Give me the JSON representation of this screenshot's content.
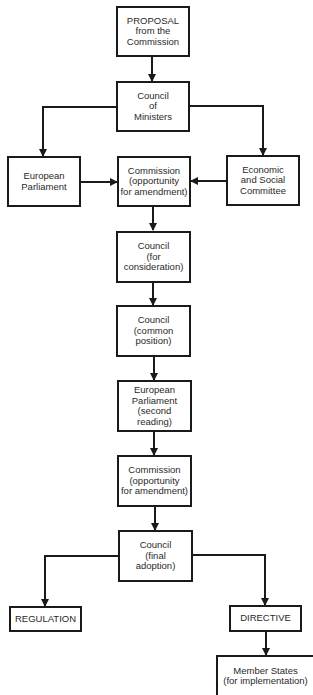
{
  "diagram": {
    "type": "flowchart",
    "nodes": {
      "proposal": {
        "lines": [
          "PROPOSAL",
          "from the",
          "Commission"
        ]
      },
      "council_ministers": {
        "lines": [
          "Council",
          "of",
          "Ministers"
        ]
      },
      "european_parliament": {
        "lines": [
          "European",
          "Parliament"
        ]
      },
      "commission_amend_1": {
        "lines": [
          "Commission",
          "(opportunity",
          "for amendment)"
        ]
      },
      "ecosoc": {
        "lines": [
          "Economic",
          "and Social",
          "Committee"
        ]
      },
      "council_consideration": {
        "lines": [
          "Council",
          "(for",
          "consideration)"
        ]
      },
      "council_common": {
        "lines": [
          "Council",
          "(common",
          "position)"
        ]
      },
      "ep_second": {
        "lines": [
          "European",
          "Parliament",
          "(second",
          "reading)"
        ]
      },
      "commission_amend_2": {
        "lines": [
          "Commission",
          "(opportunity",
          "for amendment)"
        ]
      },
      "council_final": {
        "lines": [
          "Council",
          "(final",
          "adoption)"
        ]
      },
      "regulation": {
        "lines": [
          "REGULATION"
        ]
      },
      "directive": {
        "lines": [
          "DIRECTIVE"
        ]
      },
      "member_states": {
        "lines": [
          "Member States",
          "(for implementation)"
        ]
      }
    },
    "edges": [
      [
        "proposal",
        "council_ministers"
      ],
      [
        "council_ministers",
        "european_parliament"
      ],
      [
        "council_ministers",
        "ecosoc"
      ],
      [
        "european_parliament",
        "commission_amend_1"
      ],
      [
        "ecosoc",
        "commission_amend_1"
      ],
      [
        "commission_amend_1",
        "council_consideration"
      ],
      [
        "council_consideration",
        "council_common"
      ],
      [
        "council_common",
        "ep_second"
      ],
      [
        "ep_second",
        "commission_amend_2"
      ],
      [
        "commission_amend_2",
        "council_final"
      ],
      [
        "council_final",
        "regulation"
      ],
      [
        "council_final",
        "directive"
      ],
      [
        "directive",
        "member_states"
      ]
    ],
    "colors": {
      "line": "#1a1a1a",
      "text": "#2a2a2a",
      "background": "#ffffff"
    }
  }
}
